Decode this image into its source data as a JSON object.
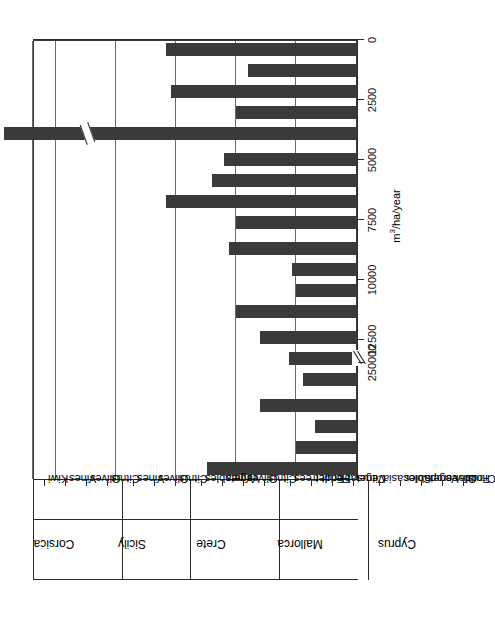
{
  "chart_data": {
    "type": "bar",
    "title": "",
    "subtitle": "",
    "orientation": "vertical-bars-rotated-90ccw",
    "xlabel": "",
    "ylabel": "m³/ha/year",
    "ylim": [
      0,
      13500
    ],
    "grid": true,
    "legend": null,
    "axis_break": {
      "present": true,
      "after_tick": 12500,
      "next_tick": 250000,
      "note": "axis is broken between 12500 and 250000; the Colocasia bar is drawn with a matching break"
    },
    "yticks": [
      0,
      2500,
      5000,
      7500,
      10000,
      12500,
      250000
    ],
    "ytick_labels": [
      "0",
      "2500",
      "5000",
      "7500",
      "10000",
      "12500",
      "250000"
    ],
    "groups": [
      {
        "name": "Corsica",
        "categories": [
          "Kiwi",
          "Vines",
          "Olives",
          "Citrus"
        ],
        "values": [
          6200,
          2500,
          1700,
          4000
        ]
      },
      {
        "name": "Sicily",
        "categories": [
          "Vines",
          "Olives",
          "Citrus"
        ],
        "values": [
          2200,
          2800,
          4000
        ]
      },
      {
        "name": "Crete",
        "categories": [
          "Vegetables",
          "Vines",
          "Olives",
          "Citrus"
        ],
        "values": [
          5000,
          2500,
          2650,
          5300
        ]
      },
      {
        "name": "Mallorca",
        "categories": [
          "Fruit trees",
          "Fodder",
          "Vegetable",
          "Citrus"
        ],
        "values": [
          5000,
          7900,
          6000,
          5500
        ]
      },
      {
        "name": "Cyprus",
        "categories": [
          "Colocasia",
          "Vegetables",
          "Fodder crops",
          "Olives",
          "Citrus"
        ],
        "values": [
          23000,
          5000,
          7700,
          4500,
          7900
        ]
      }
    ],
    "categories": [
      "Kiwi",
      "Vines",
      "Olives",
      "Citrus",
      "Vines",
      "Olives",
      "Citrus",
      "Vegetables",
      "Vines",
      "Olives",
      "Citrus",
      "Fruit trees",
      "Fodder",
      "Vegetable",
      "Citrus",
      "Colocasia",
      "Vegetables",
      "Fodder crops",
      "Olives",
      "Citrus"
    ],
    "values": [
      6200,
      2500,
      1700,
      4000,
      2200,
      2800,
      4000,
      5000,
      2500,
      2650,
      5300,
      5000,
      7900,
      6000,
      5500,
      23000,
      5000,
      7700,
      4500,
      7900
    ],
    "colors": {
      "bar": "#3a3a3a",
      "grid": "#6b6b6b",
      "axis": "#2b2b2b",
      "background": "#ffffff"
    }
  }
}
